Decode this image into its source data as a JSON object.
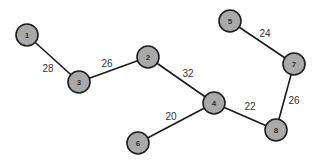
{
  "graph": {
    "type": "weighted-undirected-graph",
    "colors": {
      "node_fill": "#a9a9a9",
      "node_stroke": "#1e1e1e",
      "edge": "#1a1a1a",
      "text": "#333333",
      "background": "#ffffff"
    },
    "node_radius": 11,
    "nodes": [
      {
        "id": "1",
        "label": "1",
        "x": 27,
        "y": 35
      },
      {
        "id": "2",
        "label": "2",
        "x": 148,
        "y": 57
      },
      {
        "id": "3",
        "label": "3",
        "x": 79,
        "y": 82
      },
      {
        "id": "4",
        "label": "4",
        "x": 214,
        "y": 103
      },
      {
        "id": "5",
        "label": "5",
        "x": 230,
        "y": 21
      },
      {
        "id": "6",
        "label": "6",
        "x": 138,
        "y": 143
      },
      {
        "id": "7",
        "label": "7",
        "x": 294,
        "y": 64
      },
      {
        "id": "8",
        "label": "8",
        "x": 276,
        "y": 130
      }
    ],
    "edges": [
      {
        "from": "1",
        "to": "3",
        "weight": "28",
        "label_x": 48,
        "label_y": 68
      },
      {
        "from": "3",
        "to": "2",
        "weight": "26",
        "label_x": 107,
        "label_y": 63
      },
      {
        "from": "2",
        "to": "4",
        "weight": "32",
        "label_x": 188,
        "label_y": 73
      },
      {
        "from": "4",
        "to": "6",
        "weight": "20",
        "label_x": 171,
        "label_y": 116
      },
      {
        "from": "4",
        "to": "8",
        "weight": "22",
        "label_x": 250,
        "label_y": 106
      },
      {
        "from": "5",
        "to": "7",
        "weight": "24",
        "label_x": 265,
        "label_y": 33
      },
      {
        "from": "7",
        "to": "8",
        "weight": "26",
        "label_x": 294,
        "label_y": 100
      }
    ]
  }
}
